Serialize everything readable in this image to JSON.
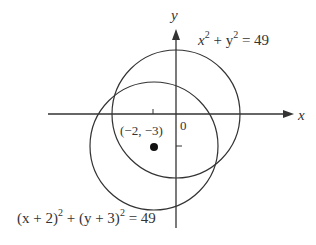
{
  "diagram": {
    "type": "coordinate-plane-circles",
    "axes": {
      "x_label": "x",
      "y_label": "y",
      "origin_label": "0"
    },
    "circles": [
      {
        "equation_parts": {
          "a": "x",
          "b": "2",
          "c": " + y",
          "d": "2",
          "e": " = 49"
        },
        "equation": "x^2 + y^2 = 49",
        "center": [
          0,
          0
        ],
        "radius": 7
      },
      {
        "equation_parts": {
          "a": "(x + 2)",
          "b": "2",
          "c": " + (y + 3)",
          "d": "2",
          "e": " = 49"
        },
        "equation": "(x + 2)^2 + (y + 3)^2 = 49",
        "center": [
          -2,
          -3
        ],
        "radius": 7
      }
    ],
    "point": {
      "label": "(−2, −3)",
      "coords": [
        -2,
        -3
      ]
    },
    "colors": {
      "stroke": "#333333",
      "text": "#333333"
    }
  }
}
